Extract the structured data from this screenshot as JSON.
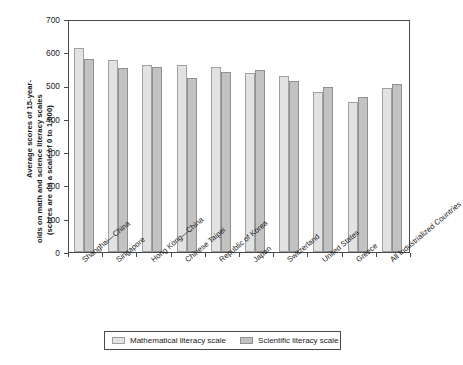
{
  "chart_data": {
    "type": "bar",
    "title": "",
    "xlabel": "",
    "ylabel": "Average scores of 15-year-olds on math and science literacy scales (scores are on a scale of 0 to 1,000)",
    "ylabel_lines": [
      "Average scores of 15-year-",
      "olds on math and science literacy scales",
      "(scores are on a scale of 0 to 1,000)"
    ],
    "ylim": [
      0,
      700
    ],
    "ytick_step": 100,
    "ytick_labels": [
      "700",
      "600",
      "500",
      "400",
      "300",
      "200",
      "100",
      "0"
    ],
    "ytick_values": [
      700,
      600,
      500,
      400,
      300,
      200,
      100,
      0
    ],
    "grid": false,
    "legend_position": "bottom",
    "categories": [
      "Shanghai—China",
      "Singapore",
      "Hong Kong—China",
      "Chinese Taipei",
      "Republic of Korea",
      "Japan",
      "Switzerland",
      "United States",
      "Greece",
      "All Industrialized Countries"
    ],
    "series": [
      {
        "name": "Mathematical  literacy scale",
        "color": "#e2e2e2",
        "values": [
          613,
          577,
          563,
          562,
          557,
          537,
          530,
          481,
          452,
          493
        ]
      },
      {
        "name": "Scientific literacy scale",
        "color": "#c2c2c2",
        "values": [
          580,
          554,
          557,
          523,
          540,
          548,
          514,
          497,
          465,
          504
        ]
      }
    ]
  },
  "legend": {
    "items": [
      {
        "label": "Mathematical  literacy scale",
        "swatch": "math"
      },
      {
        "label": "Scientific literacy scale",
        "swatch": "sci"
      }
    ]
  },
  "colors": {
    "math_bar": "#e2e2e2",
    "sci_bar": "#c2c2c2",
    "axis": "#4a4a4a",
    "text": "#1a1a1a",
    "background": "#ffffff"
  }
}
